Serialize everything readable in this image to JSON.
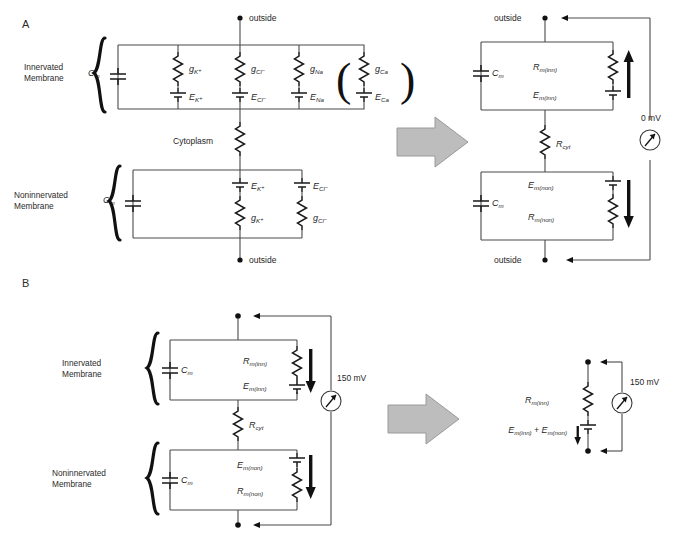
{
  "figure": {
    "panels": [
      {
        "id": "A",
        "letter": "A",
        "left_circuit": {
          "membranes": [
            {
              "name": "innervated",
              "label_line1": "Innervated",
              "label_line2": "Membrane",
              "capacitor": "C",
              "capacitor_sub": "m",
              "branches": [
                {
                  "conductance": "g",
                  "conductance_sub": "K",
                  "conductance_sup": "+",
                  "emf": "E",
                  "emf_sub": "K",
                  "emf_sup": "+"
                },
                {
                  "conductance": "g",
                  "conductance_sub": "Cl",
                  "conductance_sup": "−",
                  "emf": "E",
                  "emf_sub": "Cl",
                  "emf_sup": "−"
                },
                {
                  "conductance": "g",
                  "conductance_sub": "Na",
                  "conductance_sup": "",
                  "emf": "E",
                  "emf_sub": "Na",
                  "emf_sup": ""
                },
                {
                  "conductance": "g",
                  "conductance_sub": "Ca",
                  "conductance_sup": "",
                  "emf": "E",
                  "emf_sub": "Ca",
                  "emf_sup": "",
                  "parenthesized": true
                }
              ]
            },
            {
              "name": "noninnervated",
              "label_line1": "Noninnervated",
              "label_line2": "Membrane",
              "capacitor": "C",
              "capacitor_sub": "m",
              "branches": [
                {
                  "emf": "E",
                  "emf_sub": "K",
                  "emf_sup": "+",
                  "conductance": "g",
                  "conductance_sub": "K",
                  "conductance_sup": "+"
                },
                {
                  "emf": "E",
                  "emf_sub": "Cl",
                  "emf_sup": "−",
                  "conductance": "g",
                  "conductance_sub": "Cl",
                  "conductance_sup": "−"
                }
              ]
            }
          ],
          "cytoplasm_label": "Cytoplasm",
          "terminal_top": "outside",
          "terminal_bottom": "outside"
        },
        "right_circuit": {
          "terminal_top": "outside",
          "terminal_bottom": "outside",
          "meter_value": "0 mV",
          "top_block": {
            "capacitor": "C",
            "capacitor_sub": "m",
            "resistor": "R",
            "resistor_sub": "m(inn)",
            "battery": "E",
            "battery_sub": "m(inn)",
            "current_arrow": "up"
          },
          "cyt_resistor": {
            "symbol": "R",
            "sub": "cyt"
          },
          "bottom_block": {
            "capacitor": "C",
            "capacitor_sub": "m",
            "battery": "E",
            "battery_sub": "m(non)",
            "resistor": "R",
            "resistor_sub": "m(non)",
            "current_arrow": "down"
          }
        },
        "transform_arrow": "right-arrow"
      },
      {
        "id": "B",
        "letter": "B",
        "left_circuit": {
          "meter_value": "150 mV",
          "membranes": [
            {
              "name": "innervated",
              "label_line1": "Innervated",
              "label_line2": "Membrane",
              "capacitor": "C",
              "capacitor_sub": "m",
              "resistor": "R",
              "resistor_sub": "m(inn)",
              "battery": "E",
              "battery_sub": "m(inn)",
              "current_arrow": "down"
            },
            {
              "name": "noninnervated",
              "label_line1": "Noninnervated",
              "label_line2": "Membrane",
              "capacitor": "C",
              "capacitor_sub": "m",
              "battery": "E",
              "battery_sub": "m(non)",
              "resistor": "R",
              "resistor_sub": "m(non)",
              "current_arrow": "down"
            }
          ],
          "cyt_resistor": {
            "symbol": "R",
            "sub": "cyt"
          }
        },
        "right_circuit": {
          "meter_value": "150 mV",
          "resistor": "R",
          "resistor_sub": "m(inn)",
          "battery_expr_a": "E",
          "battery_expr_a_sub": "m(inn)",
          "battery_expr_plus": "+",
          "battery_expr_b": "E",
          "battery_expr_b_sub": "m(non)",
          "current_arrow": "down"
        },
        "transform_arrow": "right-arrow"
      }
    ]
  },
  "colors": {
    "wire": "#4a4a4a",
    "component": "#1a1a1a",
    "arrow_fill": "#bdbdbd",
    "arrow_stroke": "#9a9a9a",
    "text": "#1f1f1f"
  }
}
